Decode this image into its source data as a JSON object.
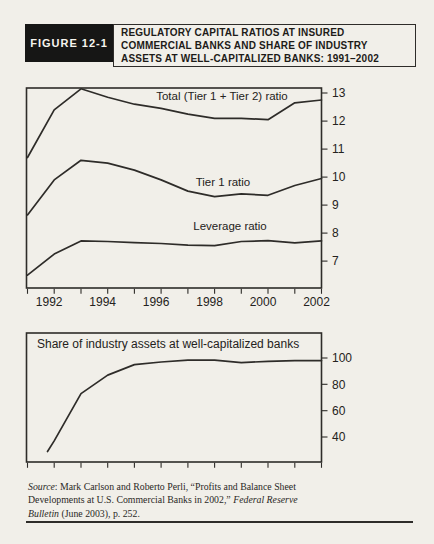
{
  "header": {
    "figure_label": "FIGURE 12-1",
    "title_lines": [
      "REGULATORY CAPITAL RATIOS AT INSURED",
      "COMMERCIAL BANKS AND SHARE OF INDUSTRY",
      "ASSETS AT WELL-CAPITALIZED BANKS: 1991–2002"
    ]
  },
  "chart_data": [
    {
      "type": "line",
      "title": "",
      "x": [
        1991,
        1992,
        1993,
        1994,
        1995,
        1996,
        1997,
        1998,
        1999,
        2000,
        2001,
        2002
      ],
      "xlim": [
        1991,
        2002
      ],
      "ylim": [
        6.04,
        13.18
      ],
      "y_ticks": [
        7,
        8,
        9,
        10,
        11,
        12,
        13
      ],
      "x_label_years": [
        1992,
        1994,
        1996,
        1998,
        2000,
        2002
      ],
      "x_tick_labels": [
        "1992",
        "1994",
        "1996",
        "1998",
        "2000",
        "2002"
      ],
      "grid": false,
      "legend_position": "inline-labels",
      "series": [
        {
          "name": "Total (Tier 1 + Tier 2) ratio",
          "values": [
            10.7,
            12.4,
            13.15,
            12.85,
            12.6,
            12.45,
            12.25,
            12.1,
            12.1,
            12.05,
            12.65,
            12.75
          ]
        },
        {
          "name": "Tier 1 ratio",
          "values": [
            8.65,
            9.9,
            10.6,
            10.5,
            10.25,
            9.9,
            9.5,
            9.3,
            9.4,
            9.35,
            9.7,
            9.95
          ]
        },
        {
          "name": "Leverage ratio",
          "values": [
            6.5,
            7.25,
            7.72,
            7.7,
            7.66,
            7.63,
            7.57,
            7.55,
            7.7,
            7.73,
            7.65,
            7.72
          ]
        }
      ]
    },
    {
      "type": "line",
      "title": "Share of industry assets at well-capitalized banks",
      "x": [
        1991,
        1992,
        1993,
        1994,
        1995,
        1996,
        1997,
        1998,
        1999,
        2000,
        2001,
        2002
      ],
      "first_point_plot_x": 1991.75,
      "xlim": [
        1991,
        2002
      ],
      "ylim": [
        21,
        119
      ],
      "y_ticks": [
        40,
        60,
        80,
        100
      ],
      "x_label_years": [],
      "x_tick_labels": [],
      "grid": false,
      "legend_position": "inline-title",
      "series": [
        {
          "name": "Share of industry assets at well-capitalized banks",
          "values": [
            29,
            37,
            73,
            87,
            95,
            97,
            98.3,
            98.3,
            96.5,
            97.5,
            98,
            98
          ]
        }
      ]
    }
  ],
  "source_note": {
    "lines": [
      [
        {
          "t": "Source",
          "i": 1
        },
        {
          "t": ": Mark Carlson and Roberto Perli, “Profits and Balance Sheet",
          "i": 0
        }
      ],
      [
        {
          "t": "Developments at U.S. Commercial Banks in 2002,” ",
          "i": 0
        },
        {
          "t": "Federal Reserve",
          "i": 1
        }
      ],
      [
        {
          "t": "Bulletin",
          "i": 1
        },
        {
          "t": " (June 2003), p. 252.",
          "i": 0
        }
      ]
    ]
  },
  "colors": {
    "line": "#2e2c29",
    "text": "#242220",
    "page_bg": "#f1efe9",
    "tag_bg": "#161615",
    "tag_text": "#f6f4ee"
  }
}
